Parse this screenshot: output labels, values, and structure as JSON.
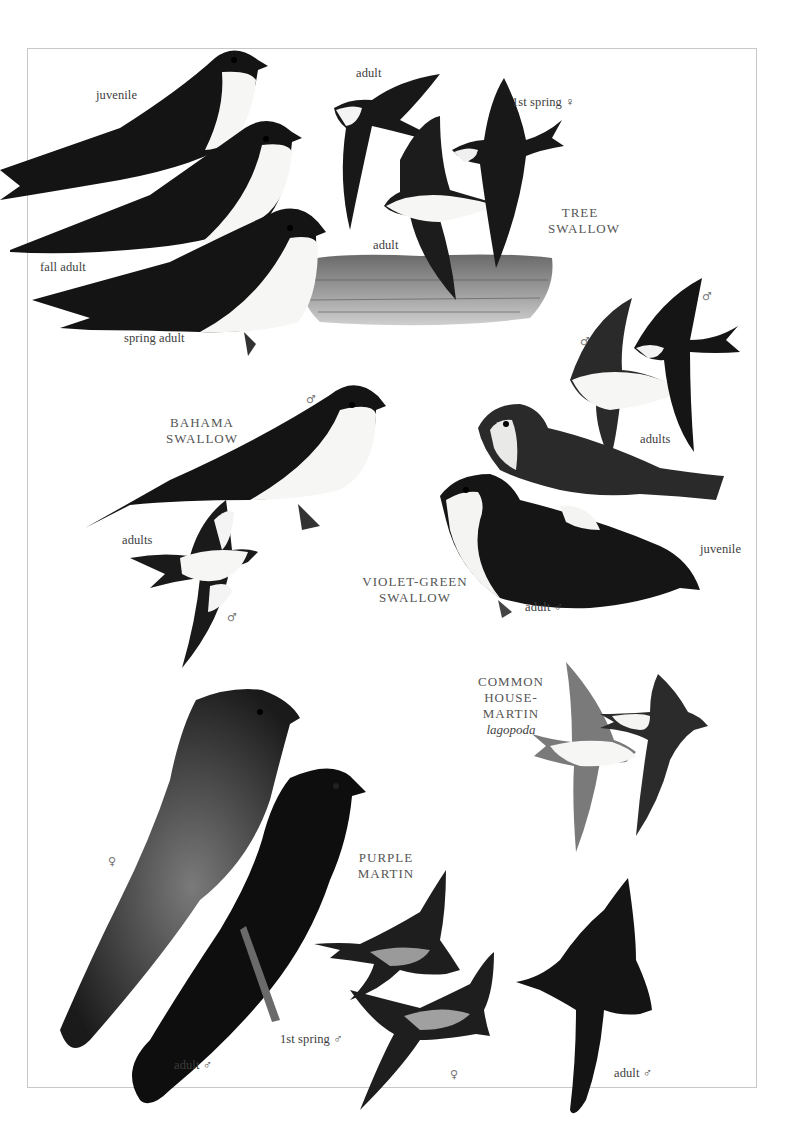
{
  "plate": {
    "species": [
      {
        "id": "tree-swallow",
        "name_line1": "TREE",
        "name_line2": "SWALLOW",
        "labels": [
          "juvenile",
          "fall adult",
          "spring adult",
          "adult",
          "adult",
          "1st spring ♀"
        ]
      },
      {
        "id": "bahama-swallow",
        "name_line1": "BAHAMA",
        "name_line2": "SWALLOW",
        "labels": [
          "adults"
        ],
        "symbols": [
          "♂",
          "♂"
        ]
      },
      {
        "id": "violet-green-swallow",
        "name_line1": "VIOLET-GREEN",
        "name_line2": "SWALLOW",
        "labels": [
          "adults",
          "juvenile",
          "adult ♂"
        ],
        "symbols": [
          "♂",
          "♂"
        ]
      },
      {
        "id": "common-house-martin",
        "name_line1": "COMMON",
        "name_line2": "HOUSE-MARTIN",
        "subspecies": "lagopoda"
      },
      {
        "id": "purple-martin",
        "name_line1": "PURPLE",
        "name_line2": "MARTIN",
        "labels": [
          "adult ♂",
          "1st spring ♂",
          "adult ♂"
        ],
        "symbols": [
          "♀",
          "♀"
        ]
      }
    ],
    "colors": {
      "ink": "#111111",
      "ink_soft": "#2a2a2a",
      "belly": "#f7f7f5",
      "wing_grey": "#5a5a5a",
      "marsh": "#8a8a8a",
      "frame": "#c8c8c8",
      "label": "#3d3d3d"
    }
  }
}
